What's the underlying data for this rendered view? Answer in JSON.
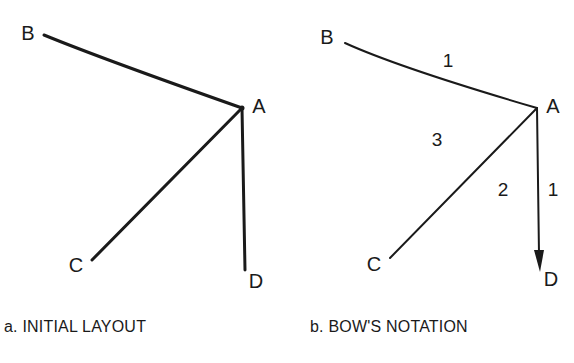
{
  "figures": [
    {
      "id": "a",
      "caption": "a. INITIAL LAYOUT",
      "nodes": [
        {
          "label": "A",
          "x": 242,
          "y": 108,
          "lx": 259,
          "ly": 106
        },
        {
          "label": "B",
          "x": 44,
          "y": 35,
          "lx": 28,
          "ly": 33
        },
        {
          "label": "C",
          "x": 92,
          "y": 260,
          "lx": 76,
          "ly": 265
        },
        {
          "label": "D",
          "x": 245,
          "y": 270,
          "lx": 256,
          "ly": 281
        }
      ],
      "edges": [
        [
          "A",
          "B"
        ],
        [
          "A",
          "C"
        ],
        [
          "A",
          "D"
        ]
      ]
    },
    {
      "id": "b",
      "caption": "b. BOW'S NOTATION",
      "nodes": [
        {
          "label": "A",
          "x": 537,
          "y": 108,
          "lx": 553,
          "ly": 106
        },
        {
          "label": "B",
          "x": 345,
          "y": 43,
          "lx": 327,
          "ly": 37
        },
        {
          "label": "C",
          "x": 390,
          "y": 258,
          "lx": 374,
          "ly": 264
        },
        {
          "label": "D",
          "x": 540,
          "y": 270,
          "lx": 551,
          "ly": 279
        }
      ],
      "edges": [
        [
          "A",
          "B"
        ],
        [
          "A",
          "C"
        ],
        [
          "A",
          "D"
        ]
      ],
      "arrow_on": "A-D",
      "space_numbers": [
        {
          "text": "1",
          "x": 448,
          "y": 60
        },
        {
          "text": "3",
          "x": 437,
          "y": 139
        },
        {
          "text": "2",
          "x": 503,
          "y": 189
        },
        {
          "text": "1",
          "x": 553,
          "y": 189
        }
      ]
    }
  ],
  "colors": {
    "ink": "#1a1a1a",
    "background": "#ffffff"
  }
}
